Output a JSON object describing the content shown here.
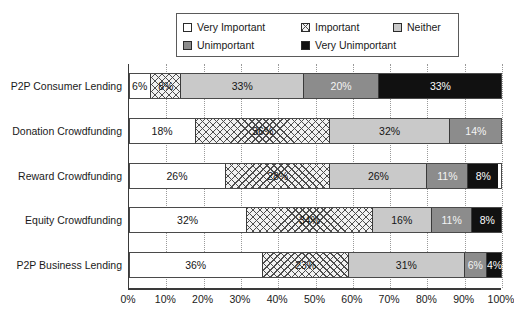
{
  "chart_data": {
    "type": "bar",
    "orientation": "horizontal",
    "stacked": true,
    "normalized": "100%",
    "title": "",
    "xlabel": "",
    "ylabel": "",
    "xlim": [
      0,
      100
    ],
    "grid": true,
    "legend_position": "top",
    "categories": [
      "P2P Consumer Lending",
      "Donation Crowdfunding",
      "Reward Crowdfunding",
      "Equity Crowdfunding",
      "P2P Business Lending"
    ],
    "xticks": [
      "0%",
      "10%",
      "20%",
      "30%",
      "40%",
      "50%",
      "60%",
      "70%",
      "80%",
      "90%",
      "100%"
    ],
    "xtick_values": [
      0,
      10,
      20,
      30,
      40,
      50,
      60,
      70,
      80,
      90,
      100
    ],
    "series": [
      {
        "name": "Very Important",
        "fill": "white",
        "color": "#ffffff",
        "values": [
          6,
          18,
          26,
          32,
          36
        ],
        "labels": [
          "6%",
          "18%",
          "26%",
          "32%",
          "36%"
        ]
      },
      {
        "name": "Important",
        "fill": "cross-hatch",
        "color": "#f2f2f2",
        "values": [
          8,
          36,
          28,
          34,
          23
        ],
        "labels": [
          "8%",
          "36%",
          "28%",
          "34%",
          "23%"
        ]
      },
      {
        "name": "Neither",
        "fill": "light-gray",
        "color": "#c9c9c9",
        "values": [
          33,
          32,
          26,
          16,
          31
        ],
        "labels": [
          "33%",
          "32%",
          "26%",
          "16%",
          "31%"
        ]
      },
      {
        "name": "Unimportant",
        "fill": "medium-gray",
        "color": "#8c8c8c",
        "values": [
          20,
          14,
          11,
          11,
          6
        ],
        "labels": [
          "20%",
          "14%",
          "11%",
          "11%",
          "6%"
        ]
      },
      {
        "name": "Very Unimportant",
        "fill": "black",
        "color": "#111111",
        "values": [
          33,
          0,
          8,
          8,
          4
        ],
        "labels": [
          "33%",
          "",
          "8%",
          "8%",
          "4%"
        ]
      }
    ]
  },
  "legend": {
    "items": [
      {
        "label": "Very Important"
      },
      {
        "label": "Important"
      },
      {
        "label": "Neither"
      },
      {
        "label": "Unimportant"
      },
      {
        "label": "Very Unimportant"
      }
    ]
  }
}
